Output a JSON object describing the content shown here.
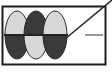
{
  "figure": {
    "type": "technical-diagram",
    "canvas": {
      "width": 112,
      "height": 75,
      "background": "#ffffff"
    },
    "frame": {
      "label": "diagram frame",
      "x": 2.5,
      "y": 6.5,
      "width": 103,
      "height": 58,
      "stroke": "#1d1d1d",
      "stroke_width": 2,
      "fill": "#ffffff"
    },
    "midline": {
      "label": "horizontal axis line",
      "x1": 4,
      "y1": 35,
      "x2": 68,
      "y2": 35,
      "stroke": "#222222",
      "stroke_width": 2
    },
    "lobes": [
      {
        "name": "lobe-1",
        "cx": 17,
        "cy": 35,
        "rx": 12,
        "ry": 24,
        "top_fill": "#d8d8d8",
        "bottom_fill": "#3a3a3a",
        "stroke": "#2a2a2a",
        "stroke_width": 1
      },
      {
        "name": "lobe-2",
        "cx": 36,
        "cy": 35,
        "rx": 12,
        "ry": 24,
        "top_fill": "#3a3a3a",
        "bottom_fill": "#d8d8d8",
        "stroke": "#2a2a2a",
        "stroke_width": 1
      },
      {
        "name": "lobe-3",
        "cx": 55,
        "cy": 35,
        "rx": 12,
        "ry": 24,
        "top_fill": "#d8d8d8",
        "bottom_fill": "#3a3a3a",
        "stroke": "#2a2a2a",
        "stroke_width": 1
      }
    ],
    "diagonal": {
      "label": "diagonal cut line",
      "x1": 65,
      "y1": 39,
      "x2": 112,
      "y2": 0,
      "stroke": "#2b2b2b",
      "stroke_width": 1.6
    },
    "marker": {
      "label": "horizontal tick segment",
      "x1": 85,
      "y1": 35,
      "x2": 103,
      "y2": 35,
      "stroke": "#9a9a9a",
      "stroke_width": 2
    },
    "colors": {
      "light_gray": "#d8d8d8",
      "dark_gray": "#3a3a3a",
      "outline": "#1d1d1d",
      "marker_gray": "#9a9a9a",
      "background": "#ffffff"
    }
  }
}
